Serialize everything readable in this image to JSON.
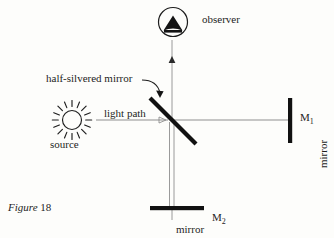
{
  "figure": {
    "caption_word": "Figure",
    "caption_number": "18"
  },
  "labels": {
    "observer": "observer",
    "source": "source",
    "half_silvered_mirror": "half-silvered mirror",
    "light_path": "light path",
    "mirror_right": "mirror",
    "mirror_bottom": "mirror",
    "m1_name": "M",
    "m1_sub": "1",
    "m2_name": "M",
    "m2_sub": "2"
  },
  "colors": {
    "ink": "#1d1d1d",
    "beam": "#8c8c8c",
    "beam_dark": "#6e6e6e",
    "background": "#fdfdfb",
    "mirror_fill": "#111111"
  },
  "diagram": {
    "type": "michelson-interferometer-schematic",
    "beamsplitter": {
      "angle_degrees": 45,
      "center": [
        172,
        120
      ],
      "length": 62,
      "thickness": 4
    },
    "components": [
      {
        "name": "source",
        "icon": "sun-icon",
        "position": [
          72,
          120
        ]
      },
      {
        "name": "observer",
        "icon": "observer-eye-icon",
        "position": [
          172,
          22
        ]
      },
      {
        "name": "mirror-m1",
        "icon": "vertical-mirror-bar",
        "position": [
          290,
          120
        ]
      },
      {
        "name": "mirror-m2",
        "icon": "horizontal-mirror-bar",
        "position": [
          172,
          208
        ]
      },
      {
        "name": "beam-splitter",
        "icon": "diagonal-mirror-bar",
        "position": [
          172,
          120
        ]
      }
    ],
    "beams": [
      {
        "from": "source",
        "to": "beam-splitter",
        "orientation": "horizontal",
        "arrowhead": "right"
      },
      {
        "from": "beam-splitter",
        "to": "mirror-m1",
        "orientation": "horizontal"
      },
      {
        "from": "beam-splitter",
        "to": "mirror-m2",
        "orientation": "vertical",
        "style": "double-line"
      },
      {
        "from": "beam-splitter",
        "to": "observer",
        "orientation": "vertical",
        "arrowhead": "up"
      }
    ]
  }
}
